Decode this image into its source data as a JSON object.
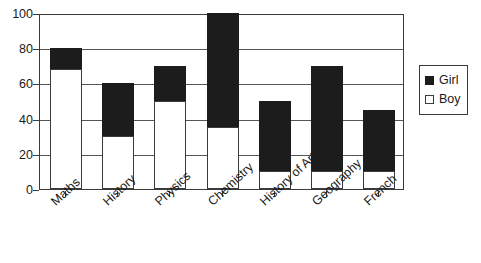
{
  "chart_data": {
    "type": "bar",
    "title": "",
    "subtitle": "",
    "xlabel": "",
    "ylabel": "",
    "stacked": true,
    "grid": true,
    "legend_position": "right",
    "ylim": [
      0,
      100
    ],
    "yticks": [
      0,
      20,
      40,
      60,
      80,
      100
    ],
    "categories": [
      "Maths",
      "History",
      "Physics",
      "Chemistry",
      "History of Art",
      "Geography",
      "French"
    ],
    "series": [
      {
        "name": "Boy",
        "color": "#ffffff",
        "values": [
          68,
          30,
          50,
          35,
          10,
          10,
          10
        ]
      },
      {
        "name": "Girl",
        "color": "#1c1c1c",
        "values": [
          12,
          30,
          20,
          65,
          40,
          60,
          35
        ]
      }
    ],
    "totals": [
      80,
      60,
      70,
      100,
      50,
      70,
      45
    ]
  },
  "legend": {
    "items": [
      {
        "label": "Girl",
        "swatch": "filled-black-square"
      },
      {
        "label": "Boy",
        "swatch": "empty-white-square"
      }
    ]
  },
  "axes": {
    "y_tick_labels": [
      "100",
      "80",
      "60",
      "40",
      "20",
      "0"
    ],
    "x_tick_labels": [
      "Maths",
      "History",
      "Physics",
      "Chemistry",
      "History of Art",
      "Geography",
      "French"
    ]
  }
}
